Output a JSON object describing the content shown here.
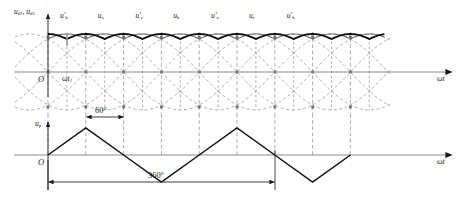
{
  "figure": {
    "kind": "twelve-pulse-rectifier-waveform",
    "background": "#ffffff",
    "ink": "#1a1a1a",
    "faint": "#8a8a8a"
  },
  "upper_plot": {
    "y_axis_label": "u",
    "y_axis_sub1": "d1",
    "y_axis_sep": ", ",
    "y_axis_label2": "u",
    "y_axis_sub2": "d2",
    "x_axis_label": "ωt",
    "origin_label": "O",
    "time_mark_label": "ωt",
    "time_mark_sub": "1",
    "phase_labels": [
      {
        "base": "u",
        "prime": "′",
        "sub": "b"
      },
      {
        "base": "u",
        "prime": "",
        "sub": "a"
      },
      {
        "base": "u",
        "prime": "′",
        "sub": "c"
      },
      {
        "base": "u",
        "prime": "",
        "sub": "b"
      },
      {
        "base": "u",
        "prime": "′",
        "sub": "a"
      },
      {
        "base": "u",
        "prime": "",
        "sub": "c"
      },
      {
        "base": "u",
        "prime": "′",
        "sub": "b"
      }
    ]
  },
  "lower_plot": {
    "y_axis_label": "u",
    "y_axis_sub": "p",
    "x_axis_label": "ωt",
    "origin_label": "O",
    "dim_60": "60°",
    "dim_360": "360°"
  },
  "chart_data": {
    "type": "line",
    "title": "",
    "xlabel": "ωt",
    "ylabel": "u_d1, u_d2 / u_p",
    "x_unit": "degrees",
    "grid": true,
    "grid_spacing_deg": 60,
    "panels": [
      {
        "name": "rectified-dc-voltages",
        "ylabel": "u_d1, u_d2",
        "series": [
          {
            "name": "u_d1",
            "style": "solid-thin",
            "kind": "six-pulse-rectified-envelope",
            "phase_offset_deg": 0,
            "period_deg": 60,
            "peak": 1.0,
            "valley": 0.866
          },
          {
            "name": "u_d2",
            "style": "solid-thick",
            "kind": "six-pulse-rectified-envelope",
            "phase_offset_deg": 30,
            "period_deg": 60,
            "peak": 1.0,
            "valley": 0.866
          },
          {
            "name": "phase voltages (dashed family)",
            "style": "dashed",
            "kind": "sinusoid-family",
            "count": 6,
            "amplitude": 1.0,
            "period_deg": 360,
            "phase_step_deg": 60
          }
        ],
        "annotations": [
          {
            "text": "u'_b",
            "x_deg": 30
          },
          {
            "text": "u_a",
            "x_deg": 90
          },
          {
            "text": "u'_c",
            "x_deg": 150
          },
          {
            "text": "u_b",
            "x_deg": 210
          },
          {
            "text": "u'_a",
            "x_deg": 270
          },
          {
            "text": "u_c",
            "x_deg": 330
          },
          {
            "text": "u'_b",
            "x_deg": 390
          }
        ]
      },
      {
        "name": "triangular-carrier",
        "ylabel": "u_p",
        "series": [
          {
            "name": "u_p",
            "style": "solid",
            "kind": "triangle",
            "period_deg": 120,
            "amplitude": 1.0,
            "start_phase_deg": 0
          }
        ],
        "annotations": [
          {
            "text": "60°",
            "from_deg": 60,
            "to_deg": 120
          },
          {
            "text": "360°",
            "from_deg": 0,
            "to_deg": 360
          }
        ]
      }
    ]
  }
}
